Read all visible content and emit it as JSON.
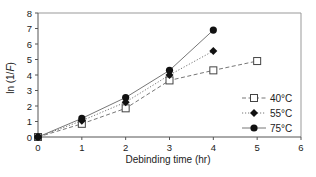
{
  "chart_data": {
    "type": "line",
    "title": "",
    "xlabel": "Debinding time (hr)",
    "ylabel": "ln (1/F)",
    "xlim": [
      0,
      6
    ],
    "ylim": [
      0,
      8
    ],
    "xticks": [
      0,
      1,
      2,
      3,
      4,
      5,
      6
    ],
    "yticks": [
      0,
      1,
      2,
      3,
      4,
      5,
      6,
      7,
      8
    ],
    "grid": false,
    "legend_position": "lower right inside",
    "series": [
      {
        "name": "40°C",
        "marker": "open-square",
        "line_style": "dashed",
        "x": [
          0,
          1,
          2,
          3,
          4,
          5
        ],
        "values": [
          0,
          0.85,
          1.85,
          3.65,
          4.3,
          4.9
        ]
      },
      {
        "name": "55°C",
        "marker": "filled-diamond",
        "line_style": "dotted",
        "x": [
          0,
          1,
          2,
          3,
          4
        ],
        "values": [
          0,
          1.05,
          2.25,
          4.0,
          5.55
        ]
      },
      {
        "name": "75°C",
        "marker": "filled-circle",
        "line_style": "solid",
        "x": [
          0,
          1,
          2,
          3,
          4
        ],
        "values": [
          0,
          1.2,
          2.55,
          4.3,
          6.9
        ]
      }
    ]
  },
  "labels": {
    "xlabel": "Debinding time (hr)",
    "ylabel_prefix": "ln (1/",
    "ylabel_italic": "F",
    "ylabel_suffix": ")",
    "legend": [
      "40°C",
      "55°C",
      "75°C"
    ]
  },
  "colors": {
    "axis": "#555555",
    "frame": "#999999",
    "line": "#777777",
    "marker": "#111111"
  }
}
